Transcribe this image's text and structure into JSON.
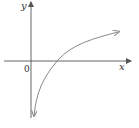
{
  "diagram": {
    "type": "function-graph",
    "axes": {
      "x_label": "x",
      "y_label": "y",
      "origin_label": "0"
    },
    "colors": {
      "axes": "#555555",
      "curve": "#888888",
      "text": "#333333"
    }
  }
}
